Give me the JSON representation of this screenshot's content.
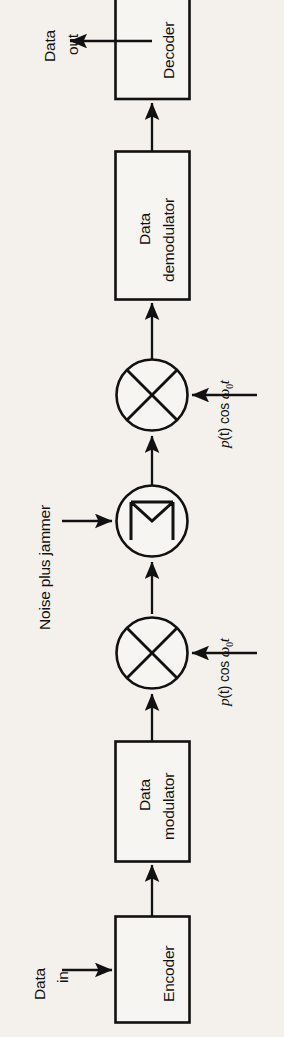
{
  "figure": {
    "kind": "block-diagram",
    "orientation": "rotated-90-ccw",
    "background_color": "#f4f1ec",
    "line_color": "#111111",
    "title": ""
  },
  "blocks": [
    {
      "id": "encoder",
      "label": "Encoder",
      "label_lines": [
        "Encoder"
      ],
      "shape": "rect"
    },
    {
      "id": "modulator",
      "label": "Data modulator",
      "label_lines": [
        "Data",
        "modulator"
      ],
      "shape": "rect"
    },
    {
      "id": "mixer_tx",
      "label": "mixer",
      "label_lines": [],
      "shape": "circle-x"
    },
    {
      "id": "summer",
      "label": "summer",
      "label_lines": [],
      "shape": "circle-sigma"
    },
    {
      "id": "mixer_rx",
      "label": "mixer",
      "label_lines": [],
      "shape": "circle-x"
    },
    {
      "id": "demodulator",
      "label": "Data demodulator",
      "label_lines": [
        "Data",
        "demodulator"
      ],
      "shape": "rect"
    },
    {
      "id": "decoder",
      "label": "Decoder",
      "label_lines": [
        "Decoder"
      ],
      "shape": "rect"
    }
  ],
  "io_labels": {
    "data_in": {
      "lines": [
        "Data",
        "in"
      ]
    },
    "data_out": {
      "lines": [
        "Data",
        "out"
      ]
    }
  },
  "annotations": {
    "noise": {
      "text": "Noise plus jammer"
    },
    "carrier_tx": {
      "prefix": "p",
      "arg": "(t)",
      "cos": "cos",
      "omega": "ω",
      "sub": "0",
      "time": "t",
      "full": "p(t) cos ω0t"
    },
    "carrier_rx": {
      "prefix": "p",
      "arg": "(t)",
      "cos": "cos",
      "omega": "ω",
      "sub": "0",
      "time": "t",
      "full": "p(t) cos ω0t"
    }
  },
  "signal_flow": [
    "Data in → Encoder",
    "Encoder → Data modulator",
    "Data modulator → mixer (p(t) cos ω0t)",
    "mixer → summer (Noise plus jammer)",
    "summer → mixer (p(t) cos ω0t)",
    "mixer → Data demodulator",
    "Data demodulator → Decoder",
    "Decoder → Data out"
  ]
}
